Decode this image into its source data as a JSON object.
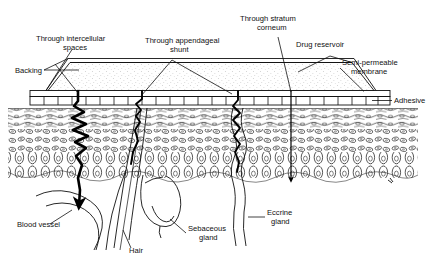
{
  "figure": {
    "background_color": "#ffffff",
    "line_color": "#111111",
    "reservoir_fill": "#fdfdfd",
    "width": 426,
    "height": 263
  },
  "labels": {
    "through_intercellular_spaces_line1": "Through intercellular",
    "through_intercellular_spaces_line2": "spaces",
    "through_appendageal_shunt_line1": "Through appendageal",
    "through_appendageal_shunt_line2": "shunt",
    "through_stratum_corneum_line1": "Through stratum",
    "through_stratum_corneum_line2": "corneum",
    "drug_reservoir": "Drug reservoir",
    "backing": "Backing",
    "semi_permeable_membrane_line1": "Semi-permeable",
    "semi_permeable_membrane_line2": "membrane",
    "adhesive": "Adhesive",
    "blood_vessel": "Blood vessel",
    "hair": "Hair",
    "sebaceous_gland_line1": "Sebaceous",
    "sebaceous_gland_line2": "gland",
    "eccrine_gland_line1": "Eccrine",
    "eccrine_gland_line2": "gland"
  },
  "routes": [
    {
      "name": "intercellular",
      "style": "thick-zigzag",
      "label_key": "through_intercellular_spaces_line1"
    },
    {
      "name": "appendageal-shunt",
      "style": "follows-hair-follicle",
      "label_key": "through_appendageal_shunt_line1"
    },
    {
      "name": "eccrine-duct",
      "style": "wavy",
      "label_key": "through_appendageal_shunt_line1"
    },
    {
      "name": "transcellular-stratum-corneum",
      "style": "straight-arrow",
      "label_key": "through_stratum_corneum_line1"
    }
  ],
  "patch_layers": [
    {
      "name": "backing",
      "label_key": "backing"
    },
    {
      "name": "drug-reservoir",
      "label_key": "drug_reservoir"
    },
    {
      "name": "semi-permeable-membrane",
      "label_key": "semi_permeable_membrane_line1"
    },
    {
      "name": "adhesive",
      "label_key": "adhesive"
    }
  ],
  "skin_structures": [
    {
      "name": "stratum-corneum"
    },
    {
      "name": "epidermis"
    },
    {
      "name": "basal-cell-layer"
    },
    {
      "name": "hair-follicle",
      "label_key": "hair"
    },
    {
      "name": "sebaceous-gland",
      "label_key": "sebaceous_gland_line1"
    },
    {
      "name": "eccrine-gland",
      "label_key": "eccrine_gland_line1"
    },
    {
      "name": "blood-vessel",
      "label_key": "blood_vessel"
    }
  ]
}
